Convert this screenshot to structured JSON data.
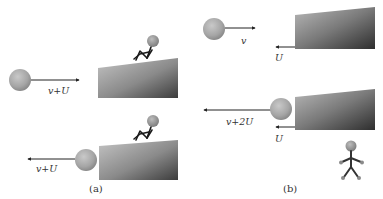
{
  "panels": {
    "a": {
      "caption": "(a)",
      "top": {
        "ball_velocity_label": "v+U",
        "ball_direction": "right"
      },
      "bottom": {
        "ball_velocity_label": "v+U",
        "ball_direction": "left"
      },
      "observer": "seated on moving block"
    },
    "b": {
      "caption": "(b)",
      "top": {
        "ball_velocity_label": "v",
        "block_velocity_label": "U"
      },
      "bottom": {
        "ball_velocity_label": "v+2U",
        "block_velocity_label": "U"
      },
      "observer": "standing on ground"
    }
  },
  "colors": {
    "ball": "#a8a8a8",
    "block_light": "#bdbdbd",
    "block_dark": "#3a3a3a",
    "arrow": "#222222",
    "text": "#333333"
  }
}
